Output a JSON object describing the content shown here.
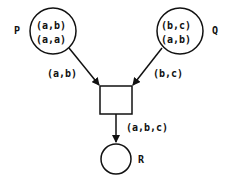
{
  "diagram": {
    "type": "petri-net",
    "places": [
      {
        "id": "P",
        "name": "P",
        "tokens": [
          "(a,b)",
          "(a,a)"
        ]
      },
      {
        "id": "Q",
        "name": "Q",
        "tokens": [
          "(b,c)",
          "(a,b)"
        ]
      },
      {
        "id": "R",
        "name": "R",
        "tokens": []
      }
    ],
    "transitions": [
      {
        "id": "T",
        "name": ""
      }
    ],
    "arcs": [
      {
        "from": "P",
        "to": "T",
        "label": "(a,b)"
      },
      {
        "from": "Q",
        "to": "T",
        "label": "(b,c)"
      },
      {
        "from": "T",
        "to": "R",
        "label": "(a,b,c)"
      }
    ],
    "colors": {
      "stroke": "#111111",
      "background": "#ffffff"
    }
  }
}
